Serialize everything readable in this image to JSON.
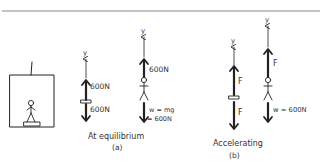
{
  "diagram": {
    "scene": {
      "label": "elevator with person standing on scale"
    },
    "panel_a": {
      "caption_line1": "At equilibrium",
      "caption_line2": "(a)",
      "scale_fbd": {
        "axis_label": "y",
        "up_force": "600N",
        "down_force": "600N"
      },
      "person_fbd": {
        "axis_label": "y",
        "up_force": "600N",
        "weight_line1": "w = mg",
        "weight_line2": "= 600N"
      }
    },
    "panel_b": {
      "caption_line1": "Accelerating",
      "caption_line2": "(b)",
      "scale_fbd": {
        "axis_label": "y",
        "up_force": "F",
        "down_force": "F"
      },
      "person_fbd": {
        "axis_label": "y",
        "up_force": "F",
        "weight": "w = 600N"
      }
    },
    "colors": {
      "ink": "#222222",
      "background": "#ffffff",
      "rule": "#888888"
    }
  }
}
